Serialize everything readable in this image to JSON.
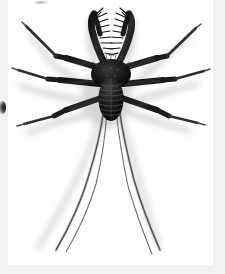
{
  "page": {
    "background_color": "#f2f2f2",
    "plate_background_color": "#ffffff",
    "artifact_label": "",
    "left_bleed_label": ""
  },
  "figure": {
    "subject_name": "tailless-whip-scorpion",
    "subject_common_name": "Tailless whip scorpion",
    "order": "Amblypygi",
    "caption": "",
    "view": "dorsal",
    "background": "white",
    "ink_color": "#1a1a1a",
    "shadow_color": "#b9b9bb",
    "parts": {
      "carapace": "cephalothorax",
      "opisthosoma": "abdomen",
      "pedipalps": "raptorial-pedipalps",
      "walking_legs": "walking-legs",
      "antenniform_legs": "antenniform-whip-legs"
    },
    "counts": {
      "pedipalps": 2,
      "walking_leg_pairs": 3,
      "antenniform_legs": 2,
      "abdomen_segments": 8
    }
  }
}
